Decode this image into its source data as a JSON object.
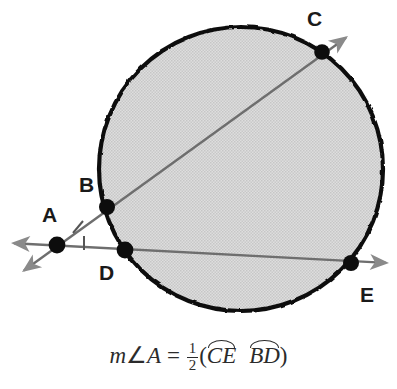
{
  "figure": {
    "type": "geometry-diagram",
    "canvas": {
      "width": 397,
      "height": 389
    },
    "circle": {
      "cx": 241,
      "cy": 169,
      "r": 142,
      "fill": "#d6d6d6",
      "stroke": "#111111"
    },
    "colors": {
      "circle_outline": "#111111",
      "circle_fill": "#d6d6d6",
      "secant_line": "#6e6e6e",
      "arrowhead": "#8a8a8a",
      "point_dot": "#0d0d0d",
      "label_text": "#1a1a1a",
      "formula_text": "#2b2b2b"
    },
    "points": [
      {
        "name": "A",
        "label": "A",
        "x": 57,
        "y": 245,
        "label_x": 42,
        "label_y": 204,
        "on_circle": false
      },
      {
        "name": "B",
        "label": "B",
        "x": 107,
        "y": 207,
        "label_x": 79,
        "label_y": 174,
        "on_circle": true
      },
      {
        "name": "C",
        "label": "C",
        "x": 322,
        "y": 52,
        "label_x": 307,
        "label_y": 8,
        "on_circle": true
      },
      {
        "name": "D",
        "label": "D",
        "x": 125,
        "y": 250,
        "label_x": 99,
        "label_y": 262,
        "on_circle": true
      },
      {
        "name": "E",
        "label": "E",
        "x": 351,
        "y": 263,
        "label_x": 360,
        "label_y": 284,
        "on_circle": true
      }
    ],
    "secants": [
      {
        "name": "secant-ABC",
        "through": [
          "A",
          "B",
          "C"
        ],
        "from_x": 22,
        "from_y": 272,
        "to_x": 348,
        "to_y": 36
      },
      {
        "name": "secant-ADE",
        "through": [
          "A",
          "D",
          "E"
        ],
        "from_x": 12,
        "from_y": 243,
        "to_x": 388,
        "to_y": 263
      }
    ],
    "arrowheads": [
      {
        "name": "arrowhead-upper-right",
        "x": 348,
        "y": 36,
        "angle": -35.8
      },
      {
        "name": "arrowhead-lower-left",
        "x": 22,
        "y": 272,
        "angle": 144.2
      },
      {
        "name": "arrowhead-right",
        "x": 388,
        "y": 263,
        "angle": 3.0
      },
      {
        "name": "arrowhead-left",
        "x": 12,
        "y": 243,
        "angle": 183.0
      }
    ],
    "angle_marks": [
      {
        "name": "angle-tick-upper",
        "x": 78,
        "y": 227
      },
      {
        "name": "angle-tick-lower",
        "x": 84,
        "y": 243
      }
    ]
  },
  "formula": {
    "full_text": "m∠A = 1/2(arc CE − arc BD)",
    "measure_prefix": "m",
    "angle_symbol": "∠",
    "vertex": "A",
    "equals": "=",
    "fraction_numerator": "1",
    "fraction_denominator": "2",
    "open_paren": "(",
    "arc_major": "CE",
    "operator": "",
    "arc_minor": "BD",
    "close_paren": ")"
  }
}
